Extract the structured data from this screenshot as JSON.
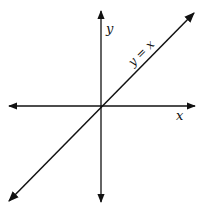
{
  "diagram": {
    "title_fragment": "",
    "axes": {
      "x_label": "x",
      "y_label": "y"
    },
    "line": {
      "label": "y = x",
      "equation": "y = x"
    },
    "colors": {
      "stroke": "#111111",
      "background": "#ffffff"
    }
  }
}
